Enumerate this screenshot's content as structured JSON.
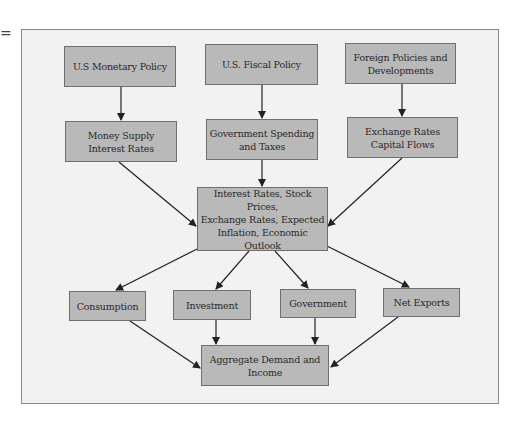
{
  "page_mark": "=",
  "colors": {
    "box_fill": "#b9b9b9",
    "box_border": "#6f6f6f",
    "frame_fill": "#f2f2f2",
    "arrow": "#222222"
  },
  "nodes": {
    "monetary_policy": "U.S Monetary Policy",
    "fiscal_policy": "U.S. Fiscal Policy",
    "foreign_policies": "Foreign Policies and\nDevelopments",
    "money_supply": "Money Supply\nInterest Rates",
    "gov_spending": "Government Spending\nand Taxes",
    "exchange_rates": "Exchange Rates\nCapital Flows",
    "center": "Interest Rates, Stock Prices,\nExchange Rates, Expected\nInflation, Economic\nOutlook",
    "consumption": "Consumption",
    "investment": "Investment",
    "government": "Government",
    "net_exports": "Net Exports",
    "aggregate": "Aggregate Demand and\nIncome"
  },
  "edges": [
    [
      "monetary_policy",
      "money_supply"
    ],
    [
      "fiscal_policy",
      "gov_spending"
    ],
    [
      "foreign_policies",
      "exchange_rates"
    ],
    [
      "money_supply",
      "center"
    ],
    [
      "gov_spending",
      "center"
    ],
    [
      "exchange_rates",
      "center"
    ],
    [
      "center",
      "consumption"
    ],
    [
      "center",
      "investment"
    ],
    [
      "center",
      "government"
    ],
    [
      "center",
      "net_exports"
    ],
    [
      "consumption",
      "aggregate"
    ],
    [
      "investment",
      "aggregate"
    ],
    [
      "government",
      "aggregate"
    ],
    [
      "net_exports",
      "aggregate"
    ]
  ]
}
